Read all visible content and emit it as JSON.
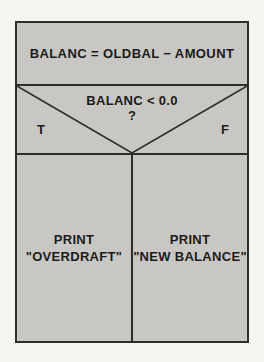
{
  "diagram": {
    "type": "nassi-shneiderman-structogram",
    "statement": "BALANC = OLDBAL − AMOUNT",
    "decision": {
      "condition": "BALANC < 0.0",
      "question_mark": "?",
      "true_label": "T",
      "false_label": "F"
    },
    "branches": {
      "true_branch": {
        "line1": "PRINT",
        "line2": "\"OVERDRAFT\""
      },
      "false_branch": {
        "line1": "PRINT",
        "line2": "\"NEW BALANCE\""
      }
    },
    "colors": {
      "page_bg": "#f5f4f1",
      "box_fill": "#c8c7c4",
      "line": "#2e2d2b",
      "text": "#1c1b19"
    }
  }
}
